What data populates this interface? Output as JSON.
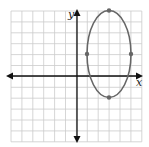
{
  "chart_data": {
    "type": "diagram",
    "title": "",
    "xlabel": "x",
    "ylabel": "y",
    "grid": true,
    "xlim": [
      -6,
      6
    ],
    "ylim": [
      -6,
      6
    ],
    "ellipse": {
      "center": [
        3,
        2
      ],
      "semi_axis_x": 2,
      "semi_axis_y": 4,
      "vertices": [
        [
          3,
          6
        ],
        [
          3,
          -2
        ]
      ],
      "co_vertices": [
        [
          1,
          2
        ],
        [
          5,
          2
        ]
      ]
    },
    "colors": {
      "grid": "#cccccc",
      "axes": "#111111",
      "curve": "#666666",
      "points": "#666666"
    }
  },
  "labels": {
    "x_axis": "x",
    "y_axis": "y"
  }
}
